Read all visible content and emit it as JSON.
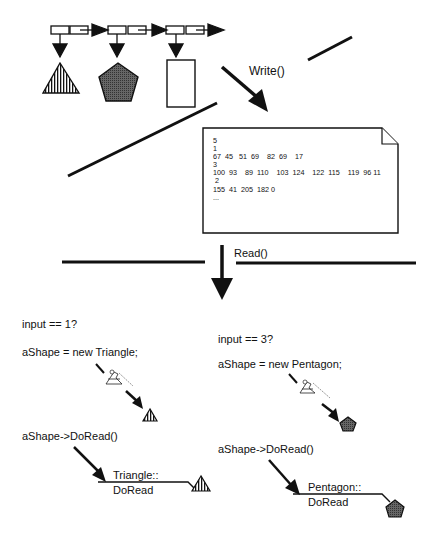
{
  "top": {
    "linked_list": {
      "nodes": 3,
      "shapes": [
        "triangle-striped",
        "pentagon-gray",
        "rectangle-empty"
      ]
    },
    "write_label": "Write()"
  },
  "file": {
    "lines": [
      "5",
      "1",
      "67  45   51  69    82  69    17",
      "3",
      "100  93    89  110    103  124    122  115    119  96 11",
      " 2",
      "155  41  205  182 0",
      "..."
    ]
  },
  "middle": {
    "read_label": "Read()"
  },
  "left_branch": {
    "condition": "input == 1?",
    "statement": "aShape = new Triangle;",
    "call": "aShape->DoRead()",
    "method_line1": "Triangle::",
    "method_line2": "DoRead"
  },
  "right_branch": {
    "condition": "input == 3?",
    "statement": "aShape = new Pentagon;",
    "call": "aShape->DoRead()",
    "method_line1": "Pentagon::",
    "method_line2": "DoRead"
  },
  "colors": {
    "ink": "#111111",
    "pentagon_fill": "#555555",
    "background": "#ffffff"
  }
}
